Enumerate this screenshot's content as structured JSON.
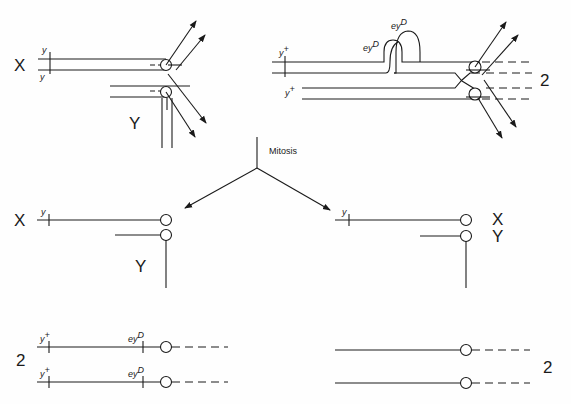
{
  "diagram": {
    "title": "",
    "caption": "",
    "process_label": "Mitosis",
    "panels": {
      "top_left": {
        "chromosome_labels": [
          "X",
          "Y"
        ],
        "gene_labels": [
          {
            "gene": "y",
            "sup": ""
          },
          {
            "gene": "y",
            "sup": ""
          }
        ]
      },
      "top_right": {
        "chromosome_count": "2",
        "gene_labels": [
          {
            "gene": "y",
            "sup": "+"
          },
          {
            "gene": "y",
            "sup": "+"
          },
          {
            "gene": "ey",
            "sup": "D"
          },
          {
            "gene": "ey",
            "sup": "D"
          }
        ]
      },
      "middle_left": {
        "chromosome_labels": [
          "X",
          "Y"
        ],
        "gene_labels": [
          {
            "gene": "y",
            "sup": ""
          }
        ]
      },
      "middle_right": {
        "chromosome_labels": [
          "X",
          "Y"
        ],
        "gene_labels": [
          {
            "gene": "y",
            "sup": ""
          }
        ]
      },
      "bottom_left": {
        "chromosome_count": "2",
        "gene_labels": [
          {
            "gene": "y",
            "sup": "+"
          },
          {
            "gene": "ey",
            "sup": "D"
          },
          {
            "gene": "y",
            "sup": "+"
          },
          {
            "gene": "ey",
            "sup": "D"
          }
        ]
      },
      "bottom_right": {
        "chromosome_count": "2"
      }
    }
  }
}
